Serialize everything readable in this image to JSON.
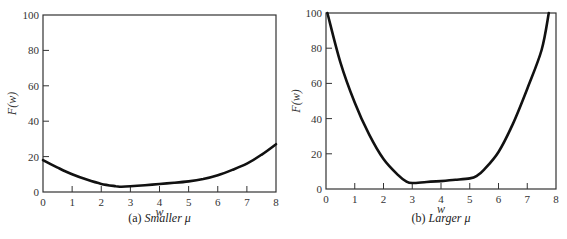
{
  "chart_data": [
    {
      "type": "line",
      "title": "",
      "caption_prefix": "(a) ",
      "caption_italic": "Smaller μ",
      "xlabel": "w",
      "ylabel": "F(w)",
      "xlim": [
        0,
        8
      ],
      "ylim": [
        0,
        100
      ],
      "xticks": [
        0,
        1,
        2,
        3,
        4,
        5,
        6,
        7,
        8
      ],
      "yticks": [
        0,
        20,
        40,
        60,
        80,
        100
      ],
      "grid": false,
      "legend": null,
      "series": [
        {
          "name": "F(w), smaller mu",
          "x": [
            0,
            0.5,
            1,
            1.5,
            2,
            2.5,
            2.7,
            3,
            3.5,
            4,
            4.5,
            5,
            5.5,
            6,
            6.5,
            7,
            7.5,
            8
          ],
          "y": [
            18,
            13.8,
            10,
            7,
            4.6,
            3.3,
            3,
            3.2,
            3.8,
            4.5,
            5.2,
            6,
            7.3,
            9.5,
            12.5,
            16,
            21,
            27
          ]
        }
      ]
    },
    {
      "type": "line",
      "title": "",
      "caption_prefix": "(b) ",
      "caption_italic": "Larger μ",
      "xlabel": "w",
      "ylabel": "F(w)",
      "xlim": [
        0,
        8
      ],
      "ylim": [
        0,
        100
      ],
      "xticks": [
        0,
        1,
        2,
        3,
        4,
        5,
        6,
        7,
        8
      ],
      "yticks": [
        0,
        20,
        40,
        60,
        80,
        100
      ],
      "grid": false,
      "legend": null,
      "series": [
        {
          "name": "F(w), larger mu",
          "x": [
            0.05,
            0.5,
            1,
            1.5,
            2,
            2.5,
            2.8,
            3,
            3.5,
            4,
            4.5,
            5,
            5.25,
            5.5,
            6,
            6.5,
            7,
            7.5,
            7.75
          ],
          "y": [
            100,
            72,
            49,
            31,
            17,
            8,
            4.2,
            3.4,
            4,
            4.5,
            5.2,
            6,
            7.5,
            11,
            21,
            37,
            57,
            79,
            100
          ]
        }
      ]
    }
  ],
  "panels": {
    "left": {
      "caption_prefix": "(a) ",
      "caption_italic": "Smaller μ",
      "xlabel": "w",
      "ylabel": "F(w)"
    },
    "right": {
      "caption_prefix": "(b) ",
      "caption_italic": "Larger μ",
      "xlabel": "w",
      "ylabel": "F(w)"
    }
  }
}
